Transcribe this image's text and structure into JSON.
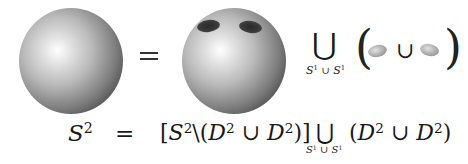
{
  "figure": {
    "top_row": {
      "left_object": "sphere",
      "relation": "=",
      "middle_object": "sphere with two holes",
      "union_operator": "⋃",
      "union_subscript": {
        "left": "S",
        "left_sup": "1",
        "op": "∪",
        "right": "S",
        "right_sup": "1"
      },
      "open_paren": "(",
      "disk_union_op": "∪",
      "close_paren": ")"
    },
    "bottom_row": {
      "lhs": {
        "base": "S",
        "sup": "2"
      },
      "relation": "=",
      "bracket_term": {
        "open": "[",
        "base": "S",
        "sup": "2",
        "setminus": "\\",
        "open_paren": "(",
        "d1": "D",
        "d1_sup": "2",
        "cup": "∪",
        "d2": "D",
        "d2_sup": "2",
        "close": ")]"
      },
      "union_operator": "⋃",
      "union_subscript": {
        "left": "S",
        "left_sup": "1",
        "op": "∪",
        "right": "S",
        "right_sup": "1"
      },
      "disk_term": {
        "open_paren": "(",
        "d1": "D",
        "d1_sup": "2",
        "cup": "∪",
        "d2": "D",
        "d2_sup": "2",
        "close_paren": ")"
      }
    }
  },
  "colors": {
    "background": "#ffffff",
    "ink": "#1a1a1a",
    "sphere_dark": "#262626",
    "sphere_light": "#ffffff",
    "disk": "#b5b5b5"
  }
}
